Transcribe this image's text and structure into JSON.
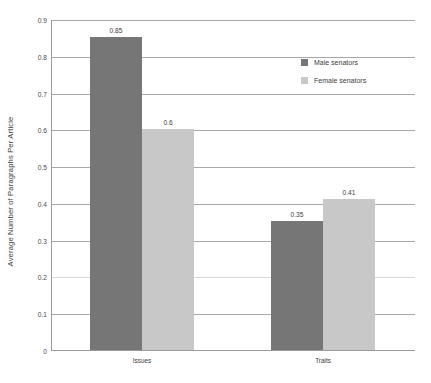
{
  "chart_data": {
    "type": "bar",
    "title": "",
    "subtitle": "",
    "xlabel": "",
    "ylabel": "Average Number of Paragraphs Per Article",
    "categories": [
      "Issues",
      "Traits"
    ],
    "series": [
      {
        "name": "Male senators",
        "color": "#767676",
        "values": [
          0.85,
          0.35
        ],
        "value_labels": [
          "0.85",
          "0.35"
        ]
      },
      {
        "name": "Female senators",
        "color": "#c8c8c8",
        "values": [
          0.6,
          0.41
        ],
        "value_labels": [
          "0.6",
          "0.41"
        ]
      }
    ],
    "ylim": [
      0,
      0.9
    ],
    "ytick_labels": [
      "0.9",
      "0.8",
      "0.7",
      "0.6",
      "0.5",
      "0.4",
      "0.3",
      "0.2",
      "0.1",
      "0"
    ],
    "ytick_values": [
      0.9,
      0.8,
      0.7,
      0.6,
      0.5,
      0.4,
      0.3,
      0.2,
      0.1,
      0
    ],
    "grid": true,
    "grid_axis": "y",
    "legend_position": "upper-right-inside"
  },
  "legend": {
    "items": [
      {
        "label": "Male senators",
        "color": "#767676"
      },
      {
        "label": "Female senators",
        "color": "#c8c8c8"
      }
    ]
  },
  "axis": {
    "y_title": "Average Number of Paragraphs Per Article"
  },
  "colors": {
    "male": "#767676",
    "female": "#c8c8c8",
    "axis": "#9a9a9a",
    "grid": "#a8a8a8",
    "background": "#ffffff"
  }
}
